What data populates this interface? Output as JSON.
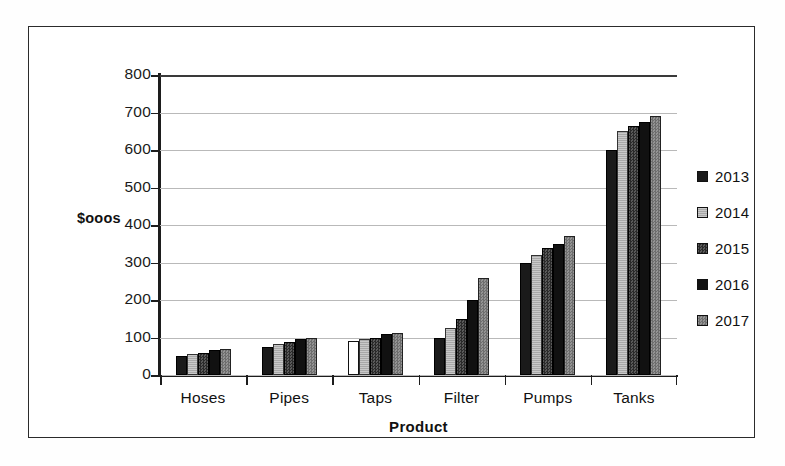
{
  "chart_data": {
    "type": "bar",
    "title": "",
    "xlabel": "Product",
    "ylabel": "$ooos",
    "ylim": [
      0,
      800
    ],
    "ytick_step": 100,
    "yticks": [
      "800",
      "700",
      "600",
      "500",
      "400",
      "300",
      "200",
      "100",
      "0"
    ],
    "grid": "horizontal",
    "legend_position": "right",
    "categories": [
      "Hoses",
      "Pipes",
      "Taps",
      "Filter",
      "Pumps",
      "Tanks"
    ],
    "series": [
      {
        "name": "2013",
        "color": "#1a1a1a",
        "values": [
          50,
          75,
          90,
          100,
          300,
          600
        ]
      },
      {
        "name": "2014",
        "color": "#b5b5b5",
        "values": [
          55,
          82,
          95,
          125,
          320,
          650
        ]
      },
      {
        "name": "2015",
        "color": "#3c3c3c",
        "values": [
          60,
          88,
          100,
          150,
          340,
          665
        ]
      },
      {
        "name": "2016",
        "color": "#111111",
        "values": [
          68,
          95,
          110,
          200,
          350,
          675
        ]
      },
      {
        "name": "2017",
        "color": "#808080",
        "values": [
          70,
          100,
          113,
          260,
          370,
          690
        ]
      }
    ]
  }
}
